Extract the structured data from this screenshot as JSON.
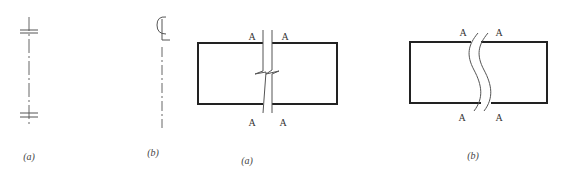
{
  "figures": [
    {
      "id": "symbol-a",
      "kind": "centerline-with-double-ticks",
      "caption": "(a)"
    },
    {
      "id": "symbol-b",
      "kind": "centerline-CL-mark",
      "caption": "(b)"
    },
    {
      "id": "break-a",
      "kind": "rectangle-with-zigzag-break",
      "section_labels": [
        "A",
        "A",
        "A",
        "A"
      ],
      "caption": "(a)"
    },
    {
      "id": "break-b",
      "kind": "rectangle-with-wavy-break",
      "section_labels": [
        "A",
        "A",
        "A",
        "A"
      ],
      "caption": "(b)"
    }
  ],
  "colors": {
    "line": "#222222",
    "thin_line": "#555555",
    "background": "#ffffff"
  }
}
